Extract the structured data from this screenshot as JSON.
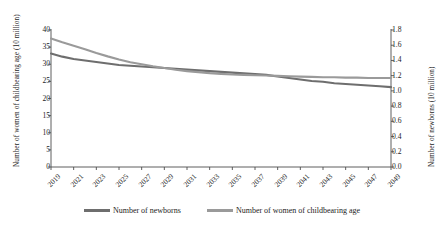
{
  "chart_data": {
    "type": "line",
    "title": "",
    "xlabel": "",
    "ylabel": "Number of women of childbearing age (10 million)",
    "y2label": "Number of newborns (10 million)",
    "grid": false,
    "legend_position": "bottom",
    "x": [
      2019,
      2020,
      2021,
      2022,
      2023,
      2024,
      2025,
      2026,
      2027,
      2028,
      2029,
      2030,
      2031,
      2032,
      2033,
      2034,
      2035,
      2036,
      2037,
      2038,
      2039,
      2040,
      2041,
      2042,
      2043,
      2044,
      2045,
      2046,
      2047,
      2048,
      2049
    ],
    "xtick_labels": [
      "2019",
      "2021",
      "2023",
      "2025",
      "2027",
      "2029",
      "2031",
      "2033",
      "2035",
      "2037",
      "2039",
      "2041",
      "2043",
      "2045",
      "2047",
      "2049"
    ],
    "ylim": [
      0,
      40
    ],
    "ytick_labels": [
      "0",
      "5",
      "10",
      "15",
      "20",
      "25",
      "30",
      "35",
      "40"
    ],
    "y2lim": [
      0.0,
      1.8
    ],
    "y2tick_labels": [
      "0.0",
      "0.2",
      "0.4",
      "0.6",
      "0.8",
      "1.0",
      "1.2",
      "1.4",
      "1.6",
      "1.8"
    ],
    "series": [
      {
        "name": "Number of newborns",
        "axis": "right",
        "color": "#6e6e6e",
        "values": [
          1.49,
          1.45,
          1.42,
          1.4,
          1.38,
          1.36,
          1.34,
          1.33,
          1.32,
          1.31,
          1.3,
          1.29,
          1.28,
          1.27,
          1.26,
          1.25,
          1.24,
          1.23,
          1.22,
          1.21,
          1.19,
          1.17,
          1.15,
          1.13,
          1.12,
          1.1,
          1.09,
          1.08,
          1.07,
          1.06,
          1.05
        ]
      },
      {
        "name": "Number of women of childbearing age",
        "axis": "left",
        "color": "#9a9a9a",
        "values": [
          37.5,
          36.4,
          35.4,
          34.4,
          33.3,
          32.3,
          31.4,
          30.6,
          30.0,
          29.4,
          28.9,
          28.4,
          28.0,
          27.7,
          27.4,
          27.2,
          27.0,
          26.9,
          26.8,
          26.7,
          26.6,
          26.5,
          26.4,
          26.3,
          26.2,
          26.2,
          26.1,
          26.1,
          26.0,
          26.0,
          26.0
        ]
      }
    ]
  },
  "legend": {
    "items": [
      {
        "label": "Number of newborns",
        "color": "#6e6e6e"
      },
      {
        "label": "Number of women of childbearing age",
        "color": "#9a9a9a"
      }
    ]
  },
  "axes": {
    "left_title": "Number of women of childbearing age (10 million)",
    "right_title": "Number of newborns (10 million)"
  }
}
